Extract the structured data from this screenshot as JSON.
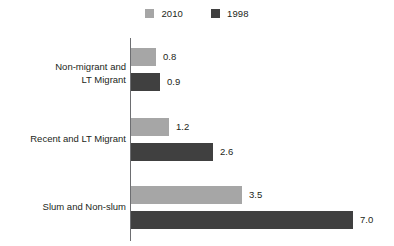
{
  "legend": {
    "entries": [
      {
        "label": "2010",
        "color": "#a6a6a6"
      },
      {
        "label": "1998",
        "color": "#404040"
      }
    ]
  },
  "chart_data": {
    "type": "bar",
    "orientation": "horizontal",
    "title": "",
    "subtitle": "",
    "xlabel": "",
    "ylabel": "",
    "grid": false,
    "legend_position": "top-center",
    "axis_only": "vertical",
    "categories": [
      "Non-migrant and LT Migrant",
      "Recent and LT Migrant",
      "Slum and Non-slum"
    ],
    "category_lines": [
      [
        "Non-migrant and",
        "LT Migrant"
      ],
      [
        "Recent and LT Migrant"
      ],
      [
        "Slum and Non-slum"
      ]
    ],
    "series": [
      {
        "name": "2010",
        "color": "#a6a6a6",
        "values": [
          0.8,
          1.2,
          3.5
        ]
      },
      {
        "name": "1998",
        "color": "#404040",
        "values": [
          0.9,
          2.6,
          7.0
        ]
      }
    ],
    "value_labels": [
      [
        "0.8",
        "1.2",
        "3.5"
      ],
      [
        "0.9",
        "2.6",
        "7.0"
      ]
    ],
    "xlim": [
      0,
      7.0
    ],
    "px_per_unit": 31.7
  },
  "groups": [
    {
      "id": "non-migrant-and-lt-migrant",
      "line1": "Non-migrant and",
      "line2": "LT Migrant",
      "label_top": 61,
      "top": 48,
      "bars": [
        {
          "series": "2010",
          "value": 0.8,
          "label": "0.8",
          "color": "#a6a6a6",
          "width": 25,
          "top": 48
        },
        {
          "series": "1998",
          "value": 0.9,
          "label": "0.9",
          "color": "#404040",
          "width": 29,
          "top": 73
        }
      ]
    },
    {
      "id": "recent-and-lt-migrant",
      "line1": "Recent and LT Migrant",
      "line2": "",
      "label_top": 133,
      "top": 118,
      "bars": [
        {
          "series": "2010",
          "value": 1.2,
          "label": "1.2",
          "color": "#a6a6a6",
          "width": 38,
          "top": 118
        },
        {
          "series": "1998",
          "value": 2.6,
          "label": "2.6",
          "color": "#404040",
          "width": 82,
          "top": 143
        }
      ]
    },
    {
      "id": "slum-and-non-slum",
      "line1": "Slum and Non-slum",
      "line2": "",
      "label_top": 201,
      "top": 186,
      "bars": [
        {
          "series": "2010",
          "value": 3.5,
          "label": "3.5",
          "color": "#a6a6a6",
          "width": 111,
          "top": 186
        },
        {
          "series": "1998",
          "value": 7.0,
          "label": "7.0",
          "color": "#404040",
          "width": 222,
          "top": 211
        }
      ]
    }
  ]
}
